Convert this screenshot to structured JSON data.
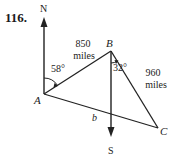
{
  "problem": {
    "number": "116."
  },
  "directions": {
    "north": "N",
    "south": "S"
  },
  "points": {
    "a": "A",
    "b": "B",
    "c": "C"
  },
  "sides": {
    "ab_value": "850",
    "ab_unit": "miles",
    "bc_value": "960",
    "bc_unit": "miles",
    "ac_label": "b"
  },
  "angles": {
    "at_a": "58°",
    "at_b": "32°"
  },
  "colors": {
    "ink": "#222222",
    "background": "#ffffff"
  }
}
